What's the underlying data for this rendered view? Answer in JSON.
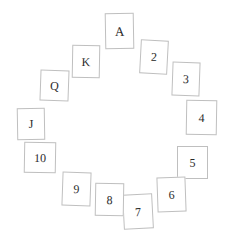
{
  "scene": {
    "title": "Circular arrangement of thirteen playing cards",
    "width": 228,
    "height": 243,
    "background_color": "#ffffff",
    "card_border_color": "#bfbfbf",
    "card_face_color": "#ffffff",
    "text_color": "#2b2b2b",
    "layout": "clock-circle",
    "card_count": 13
  },
  "cards": [
    {
      "rank": "A",
      "x": 105,
      "y": 13,
      "w": 29,
      "h": 36,
      "rotate": -1,
      "font_size": 13
    },
    {
      "rank": "2",
      "x": 140,
      "y": 40,
      "w": 28,
      "h": 34,
      "rotate": 3,
      "font_size": 12
    },
    {
      "rank": "3",
      "x": 172,
      "y": 62,
      "w": 28,
      "h": 34,
      "rotate": 2,
      "font_size": 12
    },
    {
      "rank": "4",
      "x": 186,
      "y": 100,
      "w": 31,
      "h": 35,
      "rotate": 1,
      "font_size": 12
    },
    {
      "rank": "5",
      "x": 177,
      "y": 146,
      "w": 31,
      "h": 33,
      "rotate": 0,
      "font_size": 12
    },
    {
      "rank": "6",
      "x": 157,
      "y": 177,
      "w": 29,
      "h": 35,
      "rotate": -2,
      "font_size": 12
    },
    {
      "rank": "7",
      "x": 123,
      "y": 194,
      "w": 30,
      "h": 35,
      "rotate": -3,
      "font_size": 12
    },
    {
      "rank": "8",
      "x": 95,
      "y": 183,
      "w": 29,
      "h": 33,
      "rotate": 1,
      "font_size": 12
    },
    {
      "rank": "9",
      "x": 62,
      "y": 172,
      "w": 29,
      "h": 34,
      "rotate": 2,
      "font_size": 12
    },
    {
      "rank": "10",
      "x": 24,
      "y": 142,
      "w": 32,
      "h": 31,
      "rotate": 1,
      "font_size": 12
    },
    {
      "rank": "J",
      "x": 17,
      "y": 108,
      "w": 28,
      "h": 32,
      "rotate": -1,
      "font_size": 12
    },
    {
      "rank": "Q",
      "x": 40,
      "y": 70,
      "w": 29,
      "h": 31,
      "rotate": 2,
      "font_size": 12
    },
    {
      "rank": "K",
      "x": 72,
      "y": 45,
      "w": 28,
      "h": 33,
      "rotate": 1,
      "font_size": 12
    }
  ]
}
